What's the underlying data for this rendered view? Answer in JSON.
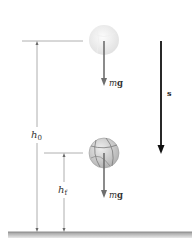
{
  "diagram": {
    "type": "physics-free-fall",
    "labels": {
      "h0_main": "h",
      "h0_sub": "0",
      "h1_main": "h",
      "h1_sub": "f",
      "displacement": "s",
      "force_upper_m": "m",
      "force_upper_g": "g",
      "force_lower_m": "m",
      "force_lower_g": "g"
    },
    "colors": {
      "ref_line": "#b0b0b0",
      "dimension_line": "#9a9a9a",
      "force_arrow": "#6e6e6e",
      "displacement_arrow": "#111111",
      "ball_ghost": "#e6e6e6",
      "ball_solid": "#c9c9c9",
      "ground": "#a8a8a8"
    }
  }
}
